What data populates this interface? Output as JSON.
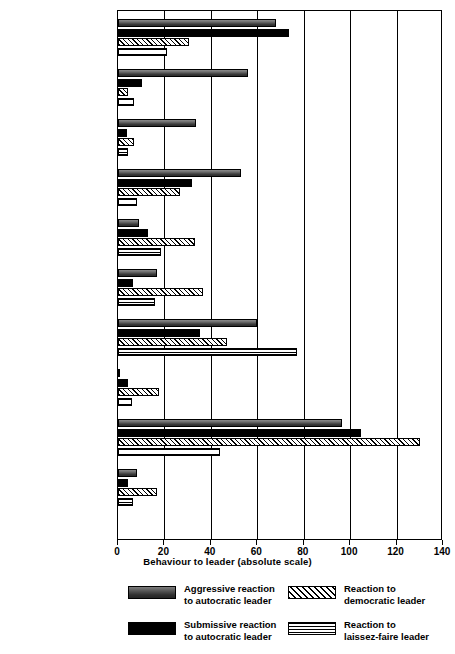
{
  "chart_data": {
    "type": "bar",
    "orientation": "horizontal",
    "title": "",
    "xlabel": "Behaviour to leader (absolute scale)",
    "ylabel": "",
    "xlim": [
      0,
      140
    ],
    "xticks": [
      0,
      20,
      40,
      60,
      80,
      100,
      120,
      140
    ],
    "grid": "vertical",
    "legend_position": "bottom",
    "categories": [
      "Leader - dependent actions",
      "Critical discontent",
      "Aggressive",
      "Demands for attention",
      "Friendly, confiding",
      "“Group-minded” suggestions",
      "Asking information",
      "Out-of - club-field conversion",
      "Work -minded conversation",
      "Work directions"
    ],
    "category_label_lines": [
      [
        "Leader - dependent",
        "actions"
      ],
      [
        "Critical discontent"
      ],
      [
        "Aggressive"
      ],
      [
        "Demands for",
        "attention"
      ],
      [
        "Friendly, confiding"
      ],
      [
        "“Group-minded”",
        "suggestions"
      ],
      [
        "Asking information"
      ],
      [
        "Out-of - club-field",
        "conversion"
      ],
      [
        "Work -minded",
        "conversation"
      ],
      [
        "Work directions"
      ]
    ],
    "series": [
      {
        "name": "Aggressive reaction to autocratic leader",
        "legend_lines": [
          "Aggressive reaction",
          "to autocratic leader"
        ],
        "pattern": "dark-grey-solid",
        "color": "#4a4a4a",
        "values": [
          68,
          56,
          33.5,
          53,
          9,
          17,
          60,
          1,
          96.5,
          8
        ]
      },
      {
        "name": "Submissive reaction to autocratic leader",
        "legend_lines": [
          "Submissive reaction",
          "to autocratic leader"
        ],
        "pattern": "black-solid",
        "color": "#000000",
        "values": [
          73.5,
          10.5,
          4,
          32,
          13,
          6.5,
          35.5,
          4.5,
          104.5,
          4.5
        ]
      },
      {
        "name": "Reaction to democratic leader",
        "legend_lines": [
          "Reaction to",
          "democratic leader"
        ],
        "pattern": "diagonal-hatch",
        "color": "#ffffff",
        "values": [
          30.5,
          4.5,
          7,
          26.5,
          33,
          36.5,
          47,
          17.5,
          130,
          17
        ]
      },
      {
        "name": "Reaction to laissez-faire leader",
        "legend_lines": [
          "Reaction to",
          "laissez-faire leader"
        ],
        "pattern": "horizontal-stripes",
        "color": "#ffffff",
        "values": [
          21,
          7,
          4.5,
          8,
          18.5,
          16,
          77,
          6,
          44,
          6.5
        ]
      }
    ]
  }
}
